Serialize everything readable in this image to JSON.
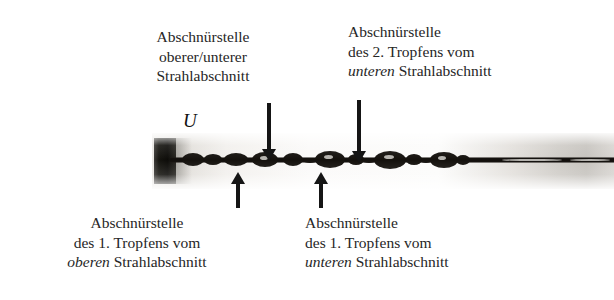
{
  "figure": {
    "background_color": "#ffffff",
    "text_color": "#262626"
  },
  "velocity_label": {
    "symbol": "U",
    "icon": "right-arrow-icon"
  },
  "labels": {
    "top_left": {
      "line1": "Abschnürstelle",
      "line2": "oberer/unterer",
      "line3": "Strahlabschnitt",
      "line3_italic": "",
      "line3_rest": ""
    },
    "top_right": {
      "line1": "Abschnürstelle",
      "line2": "des 2. Tropfens vom",
      "line3_italic": "unteren",
      "line3_rest": " Strahlabschnitt"
    },
    "bottom_left": {
      "line1": "Abschnürstelle",
      "line2": "des 1. Tropfens vom",
      "line3_italic": "oberen",
      "line3_rest": " Strahlabschnitt"
    },
    "bottom_right": {
      "line1": "Abschnürstelle",
      "line2": "des 1. Tropfens vom",
      "line3_italic": "unteren",
      "line3_rest": " Strahlabschnitt"
    }
  },
  "arrows": [
    {
      "name": "arrow-down-left",
      "direction": "down"
    },
    {
      "name": "arrow-down-right",
      "direction": "down"
    },
    {
      "name": "arrow-up-left",
      "direction": "up"
    },
    {
      "name": "arrow-up-right",
      "direction": "up"
    }
  ],
  "photograph": {
    "subject": "liquid jet breaking into droplets emerging from nozzle",
    "nozzle_color": "#0d0c09",
    "jet_color": "#14110d"
  }
}
